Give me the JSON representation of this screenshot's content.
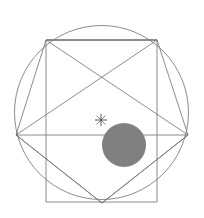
{
  "figure": {
    "width": 204,
    "height": 218,
    "background_color": "#ffffff",
    "stroke_color": "#6e6e6e",
    "stroke_width": 0.8,
    "marker_color": "#555555"
  },
  "chart_data": {
    "type": "scatter",
    "title": "",
    "subtitle": "",
    "xlabel": "",
    "ylabel": "",
    "xlim": [
      0,
      204
    ],
    "ylim": [
      0,
      218
    ],
    "grid": false,
    "legend": "none",
    "annotations": [],
    "shapes": [
      {
        "name": "outer-circle",
        "kind": "circle",
        "cx": 101.5,
        "cy": 112.5,
        "r": 87.0,
        "fill": "none",
        "stroke": "#6e6e6e"
      },
      {
        "name": "inscribed-square",
        "kind": "polygon",
        "points": [
          [
            46,
            40
          ],
          [
            157,
            40
          ],
          [
            157,
            202
          ],
          [
            46,
            202
          ]
        ],
        "fill": "none",
        "stroke": "#6e6e6e"
      },
      {
        "name": "pentagram-star",
        "kind": "polyline",
        "points": [
          [
            46,
            40
          ],
          [
            188,
            135
          ],
          [
            102,
            203
          ],
          [
            16,
            135
          ],
          [
            157,
            40
          ],
          [
            46,
            40
          ]
        ],
        "fill": "none",
        "stroke": "#6e6e6e"
      },
      {
        "name": "pentagon-outline",
        "kind": "polygon",
        "points": [
          [
            46,
            40
          ],
          [
            157,
            40
          ],
          [
            188,
            135
          ],
          [
            102,
            203
          ],
          [
            16,
            135
          ]
        ],
        "fill": "none",
        "stroke": "#6e6e6e"
      },
      {
        "name": "horizontal-chord",
        "kind": "line",
        "x1": 16,
        "y1": 135,
        "x2": 188,
        "y2": 135,
        "stroke": "#6e6e6e"
      },
      {
        "name": "gray-disk",
        "kind": "circle",
        "cx": 124,
        "cy": 145,
        "r": 22.0,
        "fill": "#808080",
        "stroke": "none"
      },
      {
        "name": "center-cross-marker",
        "kind": "cross",
        "cx": 101,
        "cy": 120,
        "size": 6,
        "stroke": "#555555"
      }
    ],
    "vertices": [
      {
        "label": "top-left",
        "x": 46,
        "y": 40
      },
      {
        "label": "top-right",
        "x": 157,
        "y": 40
      },
      {
        "label": "right",
        "x": 188,
        "y": 135
      },
      {
        "label": "bottom",
        "x": 102,
        "y": 203
      },
      {
        "label": "left",
        "x": 16,
        "y": 135
      },
      {
        "label": "bottom-left",
        "x": 46,
        "y": 202
      },
      {
        "label": "bottom-right",
        "x": 157,
        "y": 202
      }
    ]
  }
}
